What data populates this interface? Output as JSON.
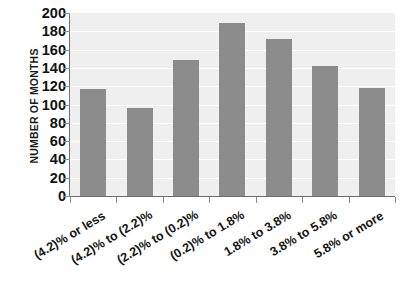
{
  "chart_data": {
    "type": "bar",
    "title": "",
    "subtitle": "",
    "xlabel": "",
    "ylabel": "NUMBER OF MONTHS",
    "categories": [
      "(4.2)% or less",
      "(4.2)% to (2.2)%",
      "(2.2)% to (0.2)%",
      "(0.2)% to 1.8%",
      "1.8% to 3.8%",
      "3.8% to 5.8%",
      "5.8% or more"
    ],
    "values": [
      117,
      96,
      149,
      189,
      172,
      142,
      118
    ],
    "ylim": [
      0,
      200
    ],
    "ytick_step": 20,
    "yticks": [
      0,
      20,
      40,
      60,
      80,
      100,
      120,
      140,
      160,
      180,
      200
    ],
    "ytick_labels": [
      "0",
      "20",
      "40",
      "60",
      "80",
      "100",
      "120",
      "140",
      "160",
      "180",
      "200"
    ],
    "grid": true,
    "grid_axis": "y",
    "legend": false,
    "legend_position": "none",
    "bar_color": "#8c8c8c",
    "plot_background": "#efefef",
    "gridline_color": "#ffffff",
    "axis_color": "#6f6f6f",
    "text_color": "#141414",
    "xtick_label_rotation": -31
  }
}
